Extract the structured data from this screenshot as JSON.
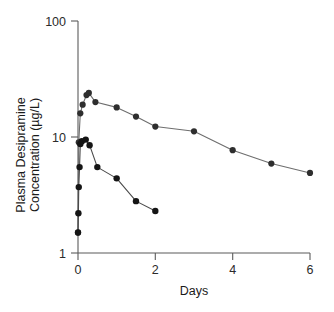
{
  "figure": {
    "background_color": "#ffffff",
    "axis_color": "#5b5b5b",
    "series_colors": [
      "#2e2e2e",
      "#151515"
    ]
  },
  "axes": {
    "x_title": "Days",
    "y_title_line1": "Plasma Desipramine",
    "y_title_line2": "Concentration (µg/L)",
    "x_ticks": [
      "0",
      "2",
      "4",
      "6"
    ],
    "y_ticks": [
      "1",
      "10",
      "100"
    ]
  },
  "chart_data": {
    "type": "line",
    "title": "",
    "xlabel": "Days",
    "ylabel": "Plasma Desipramine Concentration (µg/L)",
    "xlim": [
      0,
      6
    ],
    "ylim": [
      1,
      100
    ],
    "yscale": "log",
    "xscale": "linear",
    "grid": false,
    "legend": "none",
    "x_ticks": [
      0,
      2,
      4,
      6
    ],
    "y_ticks": [
      1,
      10,
      100
    ],
    "marker": "filled-circle",
    "series": [
      {
        "name": "Upper curve (higher dose)",
        "color": "#2e2e2e",
        "points": [
          {
            "x": 0.0,
            "y": 1.5
          },
          {
            "x": 0.02,
            "y": 9.0
          },
          {
            "x": 0.06,
            "y": 16.0
          },
          {
            "x": 0.12,
            "y": 19.0
          },
          {
            "x": 0.22,
            "y": 23.0
          },
          {
            "x": 0.28,
            "y": 24.0
          },
          {
            "x": 0.45,
            "y": 20.0
          },
          {
            "x": 1.0,
            "y": 18.0
          },
          {
            "x": 1.5,
            "y": 15.0
          },
          {
            "x": 2.0,
            "y": 12.3
          },
          {
            "x": 3.0,
            "y": 11.2
          },
          {
            "x": 4.0,
            "y": 7.7
          },
          {
            "x": 5.0,
            "y": 5.9
          },
          {
            "x": 6.0,
            "y": 4.9
          }
        ]
      },
      {
        "name": "Lower curve (lower dose)",
        "color": "#151515",
        "points": [
          {
            "x": 0.0,
            "y": 1.5
          },
          {
            "x": 0.01,
            "y": 2.2
          },
          {
            "x": 0.02,
            "y": 3.7
          },
          {
            "x": 0.04,
            "y": 5.5
          },
          {
            "x": 0.06,
            "y": 8.7
          },
          {
            "x": 0.1,
            "y": 9.2
          },
          {
            "x": 0.2,
            "y": 9.5
          },
          {
            "x": 0.3,
            "y": 8.5
          },
          {
            "x": 0.5,
            "y": 5.5
          },
          {
            "x": 1.0,
            "y": 4.4
          },
          {
            "x": 1.5,
            "y": 2.8
          },
          {
            "x": 2.0,
            "y": 2.3
          }
        ]
      }
    ]
  }
}
